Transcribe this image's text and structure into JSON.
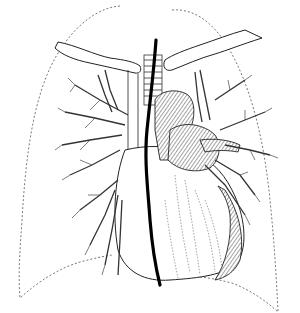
{
  "figure": {
    "structures": [
      {
        "id": "right-lung-outline",
        "style": "dotted"
      },
      {
        "id": "left-lung-outline",
        "style": "dotted"
      },
      {
        "id": "right-clavicle"
      },
      {
        "id": "left-clavicle"
      },
      {
        "id": "trachea"
      },
      {
        "id": "superior-vena-cava"
      },
      {
        "id": "aortic-arch"
      },
      {
        "id": "pulmonary-artery"
      },
      {
        "id": "heart"
      },
      {
        "id": "right-bronchial-tree"
      },
      {
        "id": "left-bronchial-tree"
      },
      {
        "id": "catheter",
        "style": "thick-black"
      }
    ],
    "colors": {
      "background": "#ffffff",
      "ink": "#222222",
      "outline_dotted": "#555555"
    }
  }
}
